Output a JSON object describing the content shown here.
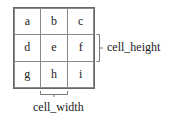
{
  "grid": {
    "rows": 3,
    "cols": 3,
    "cells": [
      "a",
      "b",
      "c",
      "d",
      "e",
      "f",
      "g",
      "h",
      "i"
    ]
  },
  "annotations": {
    "cell_height_label": "cell_height",
    "cell_width_label": "cell_width"
  },
  "colors": {
    "grid_line": "#888888",
    "text": "#222222",
    "background": "#ffffff"
  }
}
